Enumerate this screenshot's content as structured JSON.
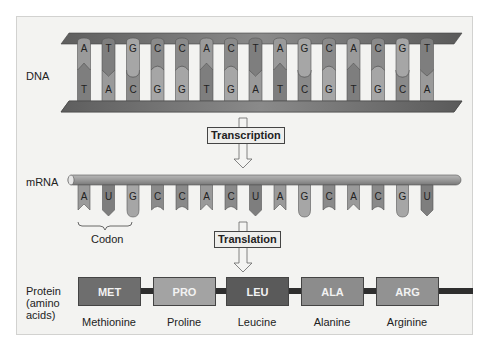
{
  "labels": {
    "dna": "DNA",
    "mrna": "mRNA",
    "protein_line1": "Protein",
    "protein_line2": "(amino",
    "protein_line3": "acids)",
    "codon": "Codon"
  },
  "processes": {
    "transcription": "Transcription",
    "translation": "Translation"
  },
  "dna": {
    "top_strand": [
      "A",
      "T",
      "G",
      "C",
      "C",
      "A",
      "C",
      "T",
      "A",
      "G",
      "C",
      "A",
      "C",
      "G",
      "T"
    ],
    "bottom_strand": [
      "T",
      "A",
      "C",
      "G",
      "G",
      "T",
      "G",
      "A",
      "T",
      "C",
      "G",
      "T",
      "G",
      "C",
      "A"
    ]
  },
  "mrna": {
    "bases": [
      "A",
      "U",
      "G",
      "C",
      "C",
      "A",
      "C",
      "U",
      "A",
      "G",
      "C",
      "A",
      "C",
      "G",
      "U"
    ]
  },
  "protein": {
    "amino_acids": [
      {
        "abbr": "MET",
        "name": "Methionine",
        "color": "#6e6e6e"
      },
      {
        "abbr": "PRO",
        "name": "Proline",
        "color": "#a3a3a3"
      },
      {
        "abbr": "LEU",
        "name": "Leucine",
        "color": "#5a5a5a"
      },
      {
        "abbr": "ALA",
        "name": "Alanine",
        "color": "#8c8c8c"
      },
      {
        "abbr": "ARG",
        "name": "Arginine",
        "color": "#929292"
      }
    ]
  },
  "colors": {
    "base_A": "#9a9a9a",
    "base_T": "#7e7e7e",
    "base_G": "#a6a6a6",
    "base_C": "#8a8a8a",
    "strand": "#6c6c6c",
    "tube": "#9b9b9b"
  }
}
